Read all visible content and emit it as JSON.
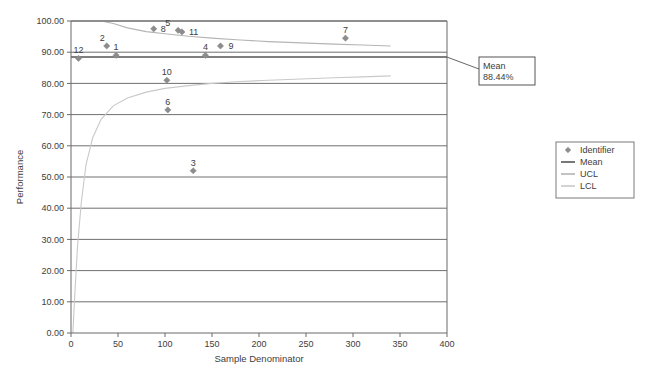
{
  "chart_data": {
    "type": "scatter",
    "title": "",
    "xlabel": "Sample Denominator",
    "ylabel": "Performance",
    "xlim": [
      0,
      400
    ],
    "ylim": [
      0,
      100
    ],
    "xticks": [
      "0",
      "50",
      "100",
      "150",
      "200",
      "250",
      "300",
      "350",
      "400"
    ],
    "xtick_values": [
      0,
      50,
      100,
      150,
      200,
      250,
      300,
      350,
      400
    ],
    "yticks": [
      "0.00",
      "10.00",
      "20.00",
      "30.00",
      "40.00",
      "50.00",
      "60.00",
      "70.00",
      "80.00",
      "90.00",
      "100.00"
    ],
    "ytick_values": [
      0,
      10,
      20,
      30,
      40,
      50,
      60,
      70,
      80,
      90,
      100
    ],
    "grid": true,
    "grid_axis": "y",
    "legend_position": "right",
    "legend": [
      {
        "label": "Identifier",
        "marker": "diamond",
        "color": "#8c8c8c"
      },
      {
        "label": "Mean",
        "marker": "line",
        "color": "#555555"
      },
      {
        "label": "UCL",
        "marker": "line",
        "color": "#b5b5b5"
      },
      {
        "label": "LCL",
        "marker": "line",
        "color": "#c9c9c9"
      }
    ],
    "mean_value": 88.44,
    "mean_annotation": {
      "line1": "Mean",
      "line2": "88.44%"
    },
    "series": [
      {
        "name": "Identifier",
        "type": "scatter",
        "marker": "diamond",
        "color": "#8c8c8c",
        "points": [
          {
            "label": "12",
            "x": 8,
            "y": 88.0,
            "label_dx": 0,
            "label_dy": -8
          },
          {
            "label": "2",
            "x": 38,
            "y": 92.0,
            "label_dx": -2,
            "label_dy": -8
          },
          {
            "label": "1",
            "x": 48,
            "y": 89.0,
            "label_dx": 0,
            "label_dy": -8
          },
          {
            "label": "8",
            "x": 88,
            "y": 97.5,
            "label_dx": 7,
            "label_dy": 0
          },
          {
            "label": "10",
            "x": 102,
            "y": 81.0,
            "label_dx": 0,
            "label_dy": -8
          },
          {
            "label": "6",
            "x": 103,
            "y": 71.5,
            "label_dx": 0,
            "label_dy": -8
          },
          {
            "label": "11",
            "x": 118,
            "y": 96.5,
            "label_dx": 7,
            "label_dy": 0
          },
          {
            "label": "5",
            "x": 114,
            "y": 97.0,
            "label_dx": -8,
            "label_dy": -7
          },
          {
            "label": "3",
            "x": 130,
            "y": 52.0,
            "label_dx": 0,
            "label_dy": -8
          },
          {
            "label": "4",
            "x": 143,
            "y": 89.0,
            "label_dx": 0,
            "label_dy": -8
          },
          {
            "label": "9",
            "x": 159,
            "y": 92.0,
            "label_dx": 8,
            "label_dy": 0
          },
          {
            "label": "7",
            "x": 292,
            "y": 94.5,
            "label_dx": 0,
            "label_dy": -8
          }
        ]
      },
      {
        "name": "UCL",
        "type": "line",
        "color": "#b5b5b5",
        "x": [
          2,
          4,
          7,
          11,
          16,
          23,
          32,
          45,
          60,
          80,
          100,
          125,
          150,
          180,
          210,
          245,
          280,
          310,
          340
        ],
        "y": [
          100.0,
          100.0,
          100.0,
          100.0,
          100.0,
          100.0,
          100.0,
          99.2,
          97.8,
          96.6,
          95.9,
          95.1,
          94.5,
          93.9,
          93.4,
          93.0,
          92.6,
          92.3,
          92.0
        ]
      },
      {
        "name": "LCL",
        "type": "line",
        "color": "#c9c9c9",
        "x": [
          2,
          4,
          7,
          11,
          16,
          23,
          32,
          45,
          60,
          80,
          100,
          125,
          150,
          180,
          210,
          245,
          280,
          310,
          340
        ],
        "y": [
          0.0,
          12.0,
          28.0,
          42.0,
          54.0,
          62.5,
          68.5,
          72.8,
          75.3,
          77.2,
          78.4,
          79.3,
          80.0,
          80.6,
          81.0,
          81.4,
          81.8,
          82.1,
          82.4
        ]
      },
      {
        "name": "Mean",
        "type": "hline",
        "color": "#555555",
        "value": 88.44
      }
    ]
  }
}
